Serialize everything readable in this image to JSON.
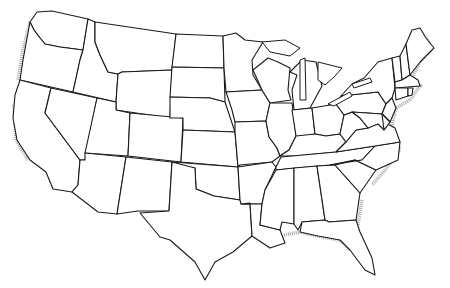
{
  "map": {
    "type": "outline-map",
    "subject": "Contiguous United States state boundaries",
    "labels_shown": false,
    "colors": {
      "fill": "#ffffff",
      "stroke": "#1a1a1a",
      "coast_shading": "#9a9a9a"
    },
    "states": [
      {
        "id": "WA",
        "points": "37,12 52,11 88,19 83,50 60,47 45,44 40,38 34,30 30,22"
      },
      {
        "id": "OR",
        "points": "30,22 34,30 40,38 45,44 60,47 83,50 80,60 73,92 20,80 23,60"
      },
      {
        "id": "CA",
        "points": "20,80 51,88 45,113 80,160 78,185 72,192 53,189 46,172 30,160 17,140 13,118 15,95"
      },
      {
        "id": "NV",
        "points": "51,88 97,98 85,160 80,160 45,113"
      },
      {
        "id": "ID",
        "points": "88,19 95,22 95,42 100,55 108,72 118,74 116,102 73,92 80,60 83,50"
      },
      {
        "id": "MT",
        "points": "95,22 176,34 172,70 122,72 118,74 108,72 100,55 95,42"
      },
      {
        "id": "WY",
        "points": "122,72 172,70 170,118 116,110 116,102 118,74"
      },
      {
        "id": "UT",
        "points": "97,98 116,102 116,110 130,113 128,156 85,153"
      },
      {
        "id": "AZ",
        "points": "85,153 126,157 117,214 98,212 72,192 78,185 80,160 85,160"
      },
      {
        "id": "CO",
        "points": "130,113 183,118 181,162 128,156"
      },
      {
        "id": "NM",
        "points": "126,157 172,162 169,211 138,211 124,213 117,214"
      },
      {
        "id": "ND",
        "points": "176,34 223,36 224,68 172,67"
      },
      {
        "id": "SD",
        "points": "172,67 224,68 225,102 210,98 170,97"
      },
      {
        "id": "NE",
        "points": "170,97 210,98 225,102 235,132 183,130 183,118 170,118"
      },
      {
        "id": "KS",
        "points": "183,130 235,132 238,167 181,162"
      },
      {
        "id": "OK",
        "points": "172,162 238,167 240,200 214,196 196,189 195,168 172,168"
      },
      {
        "id": "TX",
        "points": "172,162 195,168 196,189 214,196 240,200 250,203 252,236 233,252 215,262 205,280 195,262 170,240 160,237 140,213 169,211"
      },
      {
        "id": "MN",
        "points": "223,36 236,33 245,40 263,42 252,60 253,75 262,90 226,92 224,68"
      },
      {
        "id": "IA",
        "points": "226,92 262,90 270,103 266,121 235,122 232,110"
      },
      {
        "id": "MO",
        "points": "235,122 266,121 269,137 277,148 280,156 272,162 240,165 238,167 235,132"
      },
      {
        "id": "AR",
        "points": "238,167 272,162 276,167 265,190 262,204 241,204 240,200"
      },
      {
        "id": "LA",
        "points": "241,204 262,204 260,225 280,230 285,243 270,248 252,236 250,203"
      },
      {
        "id": "WI",
        "points": "253,70 268,58 278,62 290,68 288,90 291,100 270,103 262,90"
      },
      {
        "id": "IL",
        "points": "270,103 292,103 296,136 289,150 280,156 277,148 269,137 266,121"
      },
      {
        "id": "MI",
        "points": "290,72 302,60 316,62 322,86 310,108 294,110 292,90 297,75"
      },
      {
        "id": "IN",
        "points": "292,110 312,108 315,134 298,140 296,136"
      },
      {
        "id": "OH",
        "points": "312,108 336,104 344,115 340,134 326,136 315,134"
      },
      {
        "id": "KY",
        "points": "280,156 289,150 296,136 315,134 326,136 340,134 346,142 336,152 296,156"
      },
      {
        "id": "TN",
        "points": "276,167 281,157 336,152 375,146 362,160 330,165 276,170"
      },
      {
        "id": "MS",
        "points": "265,190 276,170 294,168 294,224 282,222 280,230 260,225 262,204"
      },
      {
        "id": "AL",
        "points": "294,168 317,166 325,220 302,222 298,230 294,224"
      },
      {
        "id": "GA",
        "points": "317,166 335,165 360,193 356,220 329,222 325,220"
      },
      {
        "id": "FL",
        "points": "302,222 325,220 329,222 356,220 360,232 372,258 375,275 365,270 350,250 340,240 318,236 300,232"
      },
      {
        "id": "SC",
        "points": "335,165 355,160 376,170 360,193"
      },
      {
        "id": "NC",
        "points": "330,165 362,160 375,146 400,142 398,160 376,170 355,160"
      },
      {
        "id": "VA",
        "points": "336,152 346,142 356,130 368,128 380,120 395,128 400,142 375,146"
      },
      {
        "id": "WV",
        "points": "340,134 344,115 352,112 360,118 368,128 356,130 346,142"
      },
      {
        "id": "PA",
        "points": "336,104 341,96 378,92 386,104 382,114 352,112 344,115"
      },
      {
        "id": "NY",
        "points": "341,96 352,84 364,78 378,62 392,58 395,88 392,98 386,104 378,92"
      },
      {
        "id": "NJ",
        "points": "386,104 392,98 396,108 390,122 382,114"
      },
      {
        "id": "MD",
        "points": "352,112 382,114 390,122 384,130 378,124 368,128 360,118"
      },
      {
        "id": "DE",
        "points": "382,114 390,122 384,130"
      },
      {
        "id": "VT",
        "points": "392,58 400,56 402,80 395,82"
      },
      {
        "id": "NH",
        "points": "400,56 406,44 410,75 402,80"
      },
      {
        "id": "MA",
        "points": "395,82 402,80 410,75 418,80 420,86 395,88"
      },
      {
        "id": "CT",
        "points": "395,88 408,88 408,96 396,100"
      },
      {
        "id": "RI",
        "points": "408,88 413,88 412,95 408,96"
      },
      {
        "id": "ME",
        "points": "406,44 412,30 420,28 426,38 434,48 420,62 410,75"
      }
    ]
  }
}
